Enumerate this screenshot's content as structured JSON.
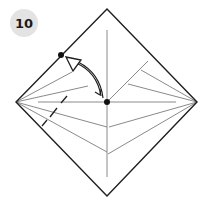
{
  "step": {
    "number": "10"
  },
  "diagram": {
    "type": "origami-fold-instruction",
    "colors": {
      "outline": "#1f1f1f",
      "crease": "#8a8a8a",
      "dot": "#111111",
      "badge_bg": "#e3e3e3",
      "arrow": "#1f1f1f"
    },
    "square": {
      "top": [
        107,
        9
      ],
      "right": [
        197,
        102
      ],
      "bottom": [
        107,
        196
      ],
      "left": [
        16,
        102
      ]
    },
    "center_dot": [
      107,
      102
    ],
    "target_dot": [
      61,
      55
    ],
    "arrow": {
      "from": [
        104,
        99
      ],
      "to": [
        67,
        58
      ],
      "style": "curved-with-hollow-head"
    },
    "valley_fold_dashed": {
      "from": [
        42,
        126
      ],
      "to": [
        67,
        96
      ]
    }
  }
}
